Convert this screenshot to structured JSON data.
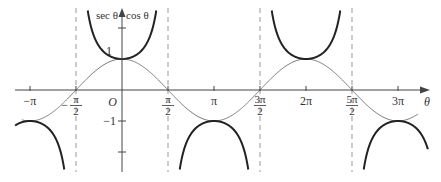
{
  "chart_data": {
    "type": "line",
    "title": "",
    "xlabel": "θ",
    "ylabel": "sec θ ▲ cos θ",
    "y_label_left": "sec θ",
    "y_label_right": "cos θ",
    "origin_label": "O",
    "xlim": [
      -3.4,
      10.0
    ],
    "ylim": [
      -2.5,
      2.8
    ],
    "x_ticks": [
      {
        "value": -3.14159,
        "label": "−π"
      },
      {
        "value": -1.5708,
        "label": "−π/2",
        "num": "π",
        "den": "2",
        "sign": "−"
      },
      {
        "value": 1.5708,
        "label": "π/2",
        "num": "π",
        "den": "2",
        "sign": ""
      },
      {
        "value": 3.14159,
        "label": "π"
      },
      {
        "value": 4.71239,
        "label": "3π/2",
        "num": "3π",
        "den": "2",
        "sign": ""
      },
      {
        "value": 6.28319,
        "label": "2π"
      },
      {
        "value": 7.85398,
        "label": "5π/2",
        "num": "5π",
        "den": "2",
        "sign": ""
      },
      {
        "value": 9.42478,
        "label": "3π"
      }
    ],
    "y_ticks": [
      {
        "value": 1,
        "label": "1"
      },
      {
        "value": 2,
        "label": ""
      },
      {
        "value": -1,
        "label": "−1"
      },
      {
        "value": -2,
        "label": ""
      }
    ],
    "asymptotes": [
      -1.5708,
      1.5708,
      4.71239,
      7.85398
    ],
    "series": [
      {
        "name": "cos θ",
        "function": "cos",
        "style": "thin",
        "color": "#777777"
      },
      {
        "name": "sec θ",
        "function": "sec",
        "style": "thick",
        "color": "#222222"
      }
    ],
    "grid": false,
    "legend": "none"
  }
}
